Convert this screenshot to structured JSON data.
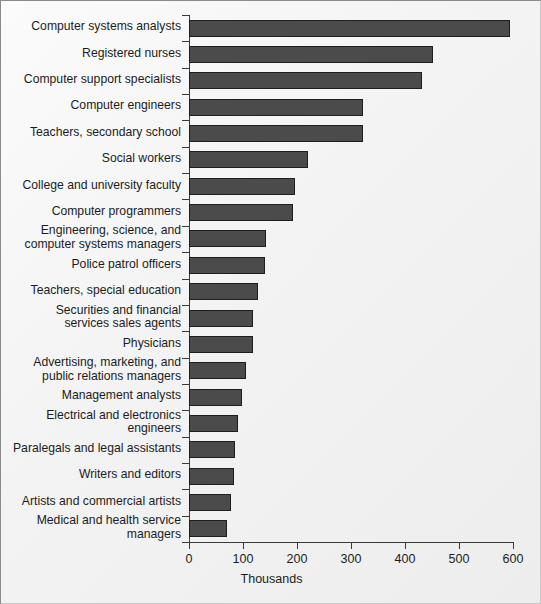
{
  "chart_data": {
    "type": "bar",
    "orientation": "horizontal",
    "title": "",
    "subtitle": "",
    "xlabel": "Thousands",
    "ylabel": "",
    "xlim": [
      0,
      600
    ],
    "xticks": [
      0,
      100,
      200,
      300,
      400,
      500,
      600
    ],
    "xtick_labels": [
      "0",
      "100",
      "200",
      "300",
      "400",
      "500",
      "600"
    ],
    "grid": false,
    "legend": null,
    "bar_color": "#4b4b4b",
    "bar_edge_color": "#1e1e1e",
    "background_color": "#f2f2f2",
    "categories": [
      "Computer systems analysts",
      "Registered nurses",
      "Computer support specialists",
      "Computer engineers",
      "Teachers, secondary school",
      "Social workers",
      "College and university faculty",
      "Computer programmers",
      "Engineering, science, and\ncomputer systems managers",
      "Police patrol officers",
      "Teachers, special education",
      "Securities and financial\nservices sales agents",
      "Physicians",
      "Advertising, marketing, and\npublic relations managers",
      "Management analysts",
      "Electrical and electronics\nengineers",
      "Paralegals and legal assistants",
      "Writers and editors",
      "Artists and commercial artists",
      "Medical and health service\nmanagers"
    ],
    "values": [
      594,
      451,
      432,
      323,
      322,
      220,
      196,
      193,
      143,
      141,
      128,
      119,
      118,
      106,
      98,
      91,
      86,
      84,
      78,
      70
    ]
  },
  "axis": {
    "x_title": "Thousands"
  }
}
